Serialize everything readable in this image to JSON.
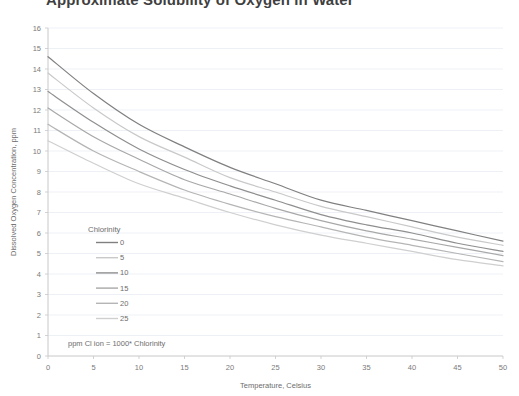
{
  "chart_data": {
    "type": "line",
    "title": "Approximate Solubility of Oxygen in Water",
    "xlabel": "Temperature, Celsius",
    "ylabel": "Dissolved Oxygen Concentration, ppm",
    "xlim": [
      0,
      50
    ],
    "ylim": [
      0,
      16
    ],
    "xticks": [
      0,
      5,
      10,
      15,
      20,
      25,
      30,
      35,
      40,
      45,
      50
    ],
    "yticks": [
      0,
      1,
      2,
      3,
      4,
      5,
      6,
      7,
      8,
      9,
      10,
      11,
      12,
      13,
      14,
      15,
      16
    ],
    "grid": true,
    "legend_title": "Chlorinity",
    "legend_position": "inside-lower-left",
    "annotation": "ppm Cl ion = 1000* Chlorinity",
    "x": [
      0,
      5,
      10,
      15,
      20,
      25,
      30,
      35,
      40,
      45,
      50
    ],
    "series": [
      {
        "name": "0",
        "color": "#808080",
        "values": [
          14.6,
          12.8,
          11.3,
          10.2,
          9.2,
          8.4,
          7.6,
          7.1,
          6.6,
          6.1,
          5.6
        ]
      },
      {
        "name": "5",
        "color": "#c9c9c9",
        "values": [
          13.8,
          12.1,
          10.7,
          9.7,
          8.7,
          8.0,
          7.3,
          6.8,
          6.3,
          5.8,
          5.4
        ]
      },
      {
        "name": "10",
        "color": "#8f8f8f",
        "values": [
          12.9,
          11.4,
          10.1,
          9.1,
          8.3,
          7.6,
          6.9,
          6.4,
          6.0,
          5.5,
          5.1
        ]
      },
      {
        "name": "15",
        "color": "#a8a8a8",
        "values": [
          12.1,
          10.7,
          9.6,
          8.6,
          7.9,
          7.2,
          6.6,
          6.1,
          5.7,
          5.3,
          4.9
        ]
      },
      {
        "name": "20",
        "color": "#b5b5b5",
        "values": [
          11.3,
          10.0,
          9.0,
          8.1,
          7.4,
          6.8,
          6.3,
          5.8,
          5.4,
          5.0,
          4.6
        ]
      },
      {
        "name": "25",
        "color": "#cfcfcf",
        "values": [
          10.5,
          9.4,
          8.4,
          7.7,
          7.0,
          6.4,
          5.9,
          5.5,
          5.1,
          4.7,
          4.4
        ]
      }
    ]
  },
  "colors": {
    "gridline": "#e8eef4",
    "axis": "#c8c8c8",
    "text": "#6d6d6d"
  }
}
